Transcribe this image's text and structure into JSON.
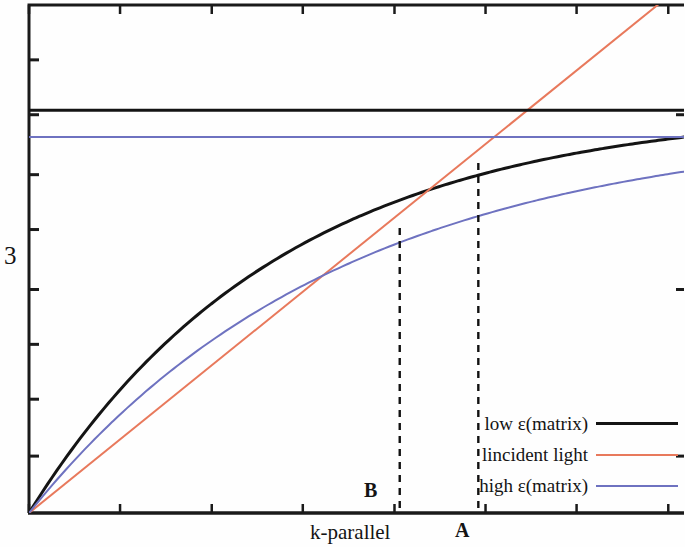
{
  "figure": {
    "background": "#fefefe",
    "frame_color": "#1a1a1a"
  },
  "axes": {
    "y_label": "3",
    "x_label": "k-parallel",
    "grid": false
  },
  "annotations": {
    "point_a_label": "A",
    "point_b_label": "B"
  },
  "legend": {
    "position": "bottom-right",
    "entries": [
      {
        "label": "low ε(matrix)",
        "color": "#141414",
        "width": 3
      },
      {
        "label": "lincident light",
        "color": "#e8795c",
        "width": 2
      },
      {
        "label": "high ε(matrix)",
        "color": "#6e72c0",
        "width": 2
      }
    ]
  },
  "chart_data": {
    "type": "line",
    "title": "",
    "xlabel": "k-parallel",
    "ylabel": "3",
    "xlim": [
      0,
      1
    ],
    "ylim": [
      0,
      1
    ],
    "grid": false,
    "axis_ticks": {
      "x_tick_fractions": [
        0.0,
        0.139,
        0.279,
        0.418,
        0.558,
        0.697,
        0.836,
        0.976
      ],
      "y_tick_fractions": [
        0.892,
        0.784,
        0.666,
        0.558,
        0.44,
        0.332,
        0.224,
        0.112
      ]
    },
    "series": [
      {
        "name": "low ε(matrix)",
        "color": "#141414",
        "style": "solid",
        "width": 3,
        "kind": "dispersion-curve",
        "asymptote": 0.74,
        "saturation": 2.6,
        "comment": "surface-plasmon dispersion for low matrix permittivity; rises steeply then saturates toward high asymptote",
        "x": [
          0.0,
          0.05,
          0.1,
          0.15,
          0.2,
          0.25,
          0.3,
          0.35,
          0.4,
          0.45,
          0.5,
          0.55,
          0.6,
          0.65,
          0.7,
          0.75,
          0.8,
          0.85,
          0.9,
          0.95,
          1.0
        ],
        "y": [
          0.0,
          0.094,
          0.182,
          0.264,
          0.339,
          0.408,
          0.47,
          0.527,
          0.578,
          0.623,
          0.663,
          0.697,
          0.725,
          0.748,
          0.765,
          0.777,
          0.784,
          0.788,
          0.79,
          0.791,
          0.792
        ]
      },
      {
        "name": "lincident light",
        "color": "#e8795c",
        "style": "solid",
        "width": 2,
        "kind": "light-line",
        "comment": "straight light line through origin, exits top edge near x=0.96",
        "x": [
          0.0,
          1.0
        ],
        "y": [
          0.0,
          1.042
        ]
      },
      {
        "name": "high ε(matrix)",
        "color": "#6e72c0",
        "style": "solid",
        "width": 2,
        "kind": "dispersion-curve",
        "asymptote": 0.672,
        "saturation": 2.1,
        "comment": "surface-plasmon dispersion for high matrix permittivity; lies below the black curve",
        "x": [
          0.0,
          0.05,
          0.1,
          0.15,
          0.2,
          0.25,
          0.3,
          0.35,
          0.4,
          0.45,
          0.5,
          0.55,
          0.6,
          0.65,
          0.7,
          0.75,
          0.8,
          0.85,
          0.9,
          0.95,
          1.0
        ],
        "y": [
          0.0,
          0.084,
          0.163,
          0.237,
          0.306,
          0.37,
          0.428,
          0.481,
          0.529,
          0.572,
          0.61,
          0.643,
          0.571,
          0.595,
          0.615,
          0.632,
          0.645,
          0.655,
          0.662,
          0.667,
          0.67
        ]
      },
      {
        "name": "low ε(matrix) asymptote",
        "color": "#141414",
        "style": "solid",
        "width": 3,
        "kind": "horizontal-asymptote",
        "y_value": 0.793
      },
      {
        "name": "high ε(matrix) asymptote",
        "color": "#6e72c0",
        "style": "solid",
        "width": 2,
        "kind": "horizontal-asymptote",
        "y_value": 0.74
      }
    ],
    "annotations": [
      {
        "label": "A",
        "type": "vertical-dashed-dropline",
        "x": 0.686,
        "y_top": 0.689,
        "y_bottom": 0.0,
        "description": "intersection of incident-light line with low ε(matrix) curve"
      },
      {
        "label": "B",
        "type": "vertical-dashed-dropline",
        "x": 0.566,
        "y_top": 0.561,
        "y_bottom": 0.0,
        "description": "intersection of incident-light line with high ε(matrix) curve"
      }
    ]
  }
}
